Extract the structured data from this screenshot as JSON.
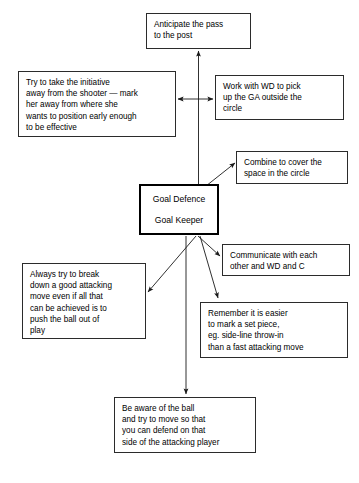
{
  "diagram": {
    "type": "mind-map",
    "center": {
      "line1": "Goal Defence",
      "line2": "Goal Keeper"
    },
    "nodes": {
      "anticipate": "Anticipate the pass\nto the post",
      "initiative": "Try to take the initiative\naway from the shooter — mark\nher away from where she\nwants to position early enough\nto be effective",
      "wd_ga": "Work with WD to pick\nup the GA outside the\ncircle",
      "combine": "Combine to cover the\nspace in the circle",
      "communicate": "Communicate with each\nother and WD and C",
      "remember": "Remember it is easier\nto mark a set piece,\neg. side-line throw-in\nthan a fast attacking move",
      "always": "Always try to break\ndown a good attacking\nmove even if all that\ncan be achieved is to\npush the ball out of\nplay",
      "aware": "Be aware of the ball\nand try to move so that\nyou can defend on that\nside of the attacking player"
    },
    "colors": {
      "background": "#ffffff",
      "stroke": "#2b2b2b",
      "center_stroke": "#000000",
      "text": "#000000"
    }
  }
}
